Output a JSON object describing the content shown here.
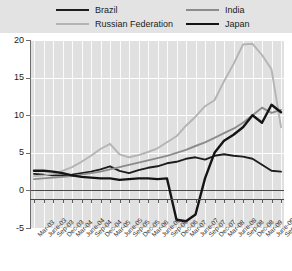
{
  "chart_data": {
    "type": "line",
    "title": "",
    "xlabel": "",
    "ylabel": "",
    "ylim": [
      -5,
      20
    ],
    "yticks": [
      -5,
      0,
      5,
      10,
      15,
      20
    ],
    "grid": "vertical-stripes-and-horizontal",
    "legend_position": "top",
    "categories": [
      "Mar-03",
      "June-03",
      "Sep-03",
      "Dec-03",
      "Mar-04",
      "June-04",
      "Sep-04",
      "Dec-04",
      "Mar-05",
      "June-05",
      "Sep-05",
      "Dec-05",
      "Mar-06",
      "June-06",
      "Sep-06",
      "Dec-06",
      "Mar-07",
      "June-07",
      "Sep-07",
      "Dec-07",
      "Mar-08",
      "June-08",
      "Sep-08",
      "Dec-08",
      "Mar-09",
      "June-09",
      "Sep-09"
    ],
    "series": [
      {
        "name": "Brazil",
        "color": "#1d1d1d",
        "width": 1.9,
        "values": [
          2.2,
          2.1,
          2.0,
          2.0,
          2.1,
          2.3,
          2.5,
          2.8,
          3.2,
          2.6,
          2.3,
          2.7,
          3.0,
          3.2,
          3.6,
          3.8,
          4.2,
          4.4,
          4.1,
          4.6,
          4.8,
          4.6,
          4.5,
          4.2,
          3.4,
          2.6,
          2.5
        ]
      },
      {
        "name": "Russian Federation",
        "color": "#b4b4b4",
        "width": 1.9,
        "values": [
          1.9,
          2.0,
          2.2,
          2.6,
          3.1,
          3.8,
          4.6,
          5.5,
          6.2,
          4.8,
          4.4,
          4.7,
          5.1,
          5.6,
          6.4,
          7.2,
          8.6,
          9.8,
          11.2,
          12.0,
          14.5,
          16.8,
          19.4,
          19.5,
          18.0,
          16.1,
          8.4
        ]
      },
      {
        "name": "India",
        "color": "#8c8c8c",
        "width": 1.9,
        "values": [
          1.5,
          1.6,
          1.7,
          1.8,
          1.9,
          2.1,
          2.3,
          2.5,
          2.8,
          3.1,
          3.4,
          3.7,
          4.0,
          4.3,
          4.6,
          5.0,
          5.4,
          5.9,
          6.4,
          7.0,
          7.6,
          8.2,
          9.0,
          10.0,
          11.0,
          10.3,
          10.7
        ]
      },
      {
        "name": "Japan",
        "color": "#141414",
        "width": 2.4,
        "values": [
          2.6,
          2.6,
          2.5,
          2.3,
          2.0,
          1.8,
          1.7,
          1.6,
          1.6,
          1.4,
          1.5,
          1.6,
          1.6,
          1.5,
          1.6,
          -3.9,
          -4.1,
          -3.2,
          1.6,
          5.0,
          6.6,
          7.4,
          8.4,
          10.0,
          9.0,
          11.4,
          10.4
        ]
      }
    ]
  },
  "legend": {
    "items": [
      {
        "label": "Brazil"
      },
      {
        "label": "Russian Federation"
      },
      {
        "label": "India"
      },
      {
        "label": "Japan"
      }
    ]
  }
}
